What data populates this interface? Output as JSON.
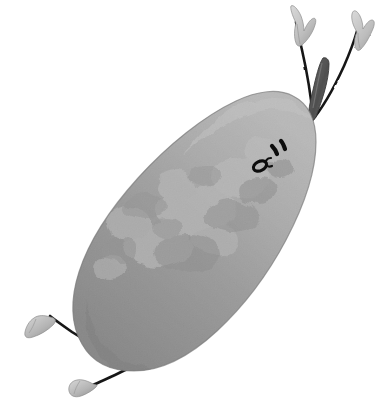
{
  "artwork": {
    "title": "Cartoon Pear Character",
    "subject": "pear",
    "style": "hand-drawn watercolor / pencil-texture illustration",
    "alt_text": "A grey mottled pear drawn as a cartoon character, tilted diagonally, with a short stem, two thin arms ending in leaf-like mittens raised upward, two thin legs with wedge-shaped feet, and a small face with two slanted dash eyes and an oval open mouth.",
    "orientation_degrees": -35,
    "background_color": "#ffffff",
    "canvas": {
      "width": 390,
      "height": 411
    }
  },
  "palette": {
    "background": "#ffffff",
    "body_light": "#c0c0c0",
    "body_mid": "#9d9d9d",
    "body_dark": "#848484",
    "body_shadow": "#6f6f6f",
    "blotch_light": "#b9b9b9",
    "blotch_dark": "#8a8a8a",
    "outline": "#141414",
    "limb_line": "#191919",
    "stem_fill": "#5e5e5e",
    "stem_dark": "#3d3d3d",
    "extremity_fill": "#c8c8c8",
    "extremity_shade": "#9a9a9a",
    "face_ink": "#101010"
  },
  "parts": {
    "body": {
      "label": "Pear body",
      "fill": "#9d9d9d",
      "texture": "mottled grainy blotches"
    },
    "stem": {
      "label": "Stem",
      "fill": "#5e5e5e"
    },
    "left_arm": {
      "label": "Left arm",
      "stroke": "#191919",
      "hand": "leaf mitten"
    },
    "right_arm": {
      "label": "Right arm",
      "stroke": "#191919",
      "hand": "leaf mitten"
    },
    "left_leg": {
      "label": "Left leg",
      "stroke": "#191919",
      "foot": "wedge foot"
    },
    "right_leg": {
      "label": "Right leg",
      "stroke": "#191919",
      "foot": "wedge foot"
    },
    "face": {
      "label": "Face",
      "eye_left": "slanted dash",
      "eye_right": "slanted dash",
      "cheek_mark": "small c curve",
      "mouth": "small oval"
    }
  }
}
